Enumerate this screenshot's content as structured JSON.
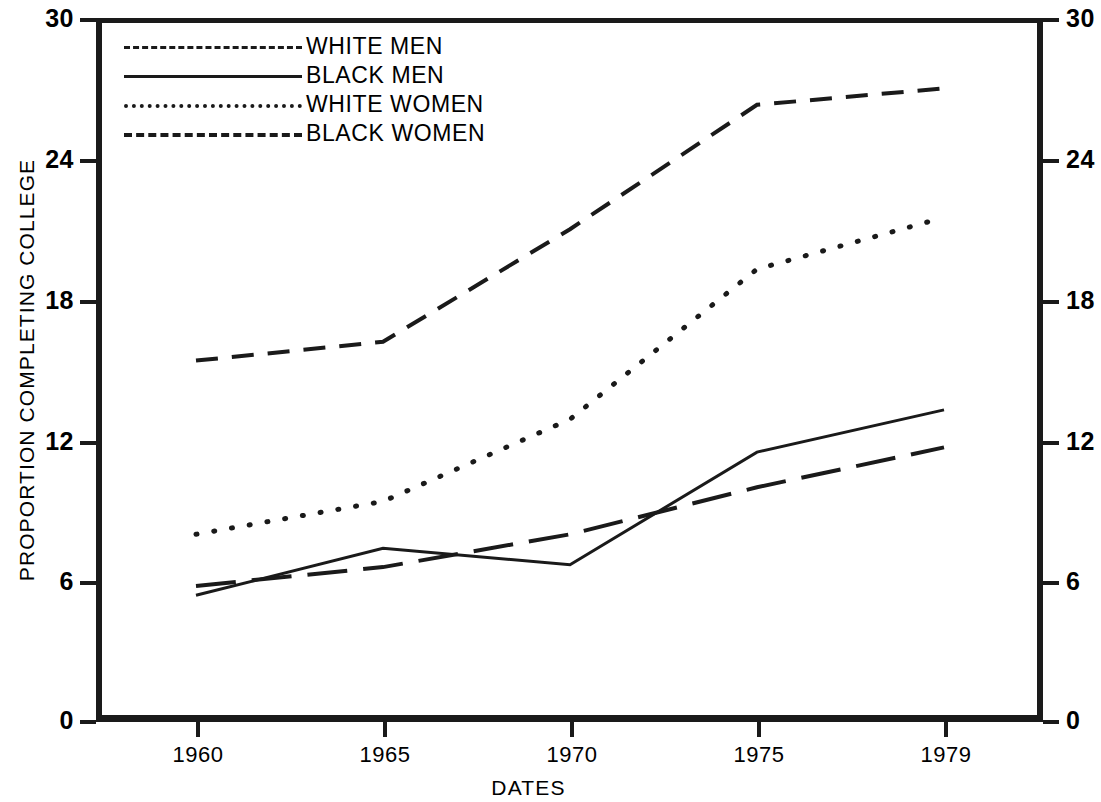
{
  "chart_data": {
    "type": "line",
    "title": "",
    "xlabel": "DATES",
    "ylabel": "PROPORTION COMPLETING COLLEGE",
    "x": [
      1960,
      1965,
      1970,
      1975,
      1979
    ],
    "xtick_labels": [
      "1960",
      "1965",
      "1970",
      "1975",
      "1979"
    ],
    "ytick_labels": [
      "0",
      "6",
      "12",
      "18",
      "24",
      "30"
    ],
    "ytick_values": [
      0,
      6,
      12,
      18,
      24,
      30
    ],
    "ylim": [
      0,
      30
    ],
    "xlim": [
      1958.3,
      1981.3
    ],
    "grid": false,
    "legend_position": "upper-left-inside",
    "dual_y_axis": true,
    "series": [
      {
        "name": "WHITE MEN",
        "style": "dashed",
        "color": "#1a1a1a",
        "values": [
          15.4,
          16.2,
          21.0,
          26.3,
          27.0
        ]
      },
      {
        "name": "BLACK MEN",
        "style": "solid",
        "color": "#1a1a1a",
        "values": [
          5.4,
          7.4,
          6.7,
          11.5,
          13.3
        ]
      },
      {
        "name": "WHITE WOMEN",
        "style": "dotted",
        "color": "#1a1a1a",
        "values": [
          8.0,
          9.4,
          12.9,
          19.3,
          21.5
        ]
      },
      {
        "name": "BLACK WOMEN",
        "style": "longdash",
        "color": "#1a1a1a",
        "values": [
          5.8,
          6.6,
          8.0,
          10.0,
          11.7
        ]
      }
    ]
  },
  "axes": {
    "left_labels": [
      "30",
      "24",
      "18",
      "12",
      "6",
      "0"
    ],
    "right_labels": [
      "30",
      "24",
      "18",
      "12",
      "6",
      "0"
    ],
    "x_labels": [
      "1960",
      "1965",
      "1970",
      "1975",
      "1979"
    ],
    "y_title": "PROPORTION COMPLETING COLLEGE",
    "x_title": "DATES"
  },
  "legend": {
    "items": [
      {
        "label": "WHITE MEN",
        "style": "dashed"
      },
      {
        "label": "BLACK MEN",
        "style": "solid"
      },
      {
        "label": "WHITE WOMEN",
        "style": "dotted"
      },
      {
        "label": "BLACK WOMEN",
        "style": "longdash"
      }
    ]
  },
  "style": {
    "ink": "#1a1a1a",
    "paper": "#ffffff"
  }
}
